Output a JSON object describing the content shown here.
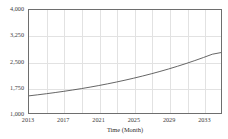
{
  "chart_data": {
    "type": "line",
    "title": "",
    "xlabel": "Time (Month)",
    "ylabel": "",
    "grid": true,
    "legend": "none",
    "xlim": [
      2013,
      2035
    ],
    "ylim": [
      1000,
      4000
    ],
    "x_tick_labels": [
      "2013",
      "2017",
      "2021",
      "2025",
      "2029",
      "2033"
    ],
    "x_tick_values": [
      2013,
      2017,
      2021,
      2025,
      2029,
      2033
    ],
    "x_minor_gridlines": [
      2015,
      2017,
      2019,
      2021,
      2023,
      2025,
      2027,
      2029,
      2031,
      2033
    ],
    "y_tick_labels": [
      "1,000",
      "1,750",
      "2,500",
      "3,250",
      "4,000"
    ],
    "y_tick_values": [
      1000,
      1750,
      2500,
      3250,
      4000
    ],
    "series": [
      {
        "name": "forecast",
        "color": "#555555",
        "x": [
          2013,
          2014,
          2015,
          2016,
          2017,
          2018,
          2019,
          2020,
          2021,
          2022,
          2023,
          2024,
          2025,
          2026,
          2027,
          2028,
          2029,
          2030,
          2031,
          2032,
          2033,
          2034,
          2035
        ],
        "values": [
          1500,
          1530,
          1562,
          1596,
          1632,
          1670,
          1711,
          1754,
          1800,
          1849,
          1901,
          1956,
          2014,
          2076,
          2141,
          2210,
          2283,
          2360,
          2441,
          2527,
          2617,
          2712,
          2760
        ]
      }
    ]
  }
}
